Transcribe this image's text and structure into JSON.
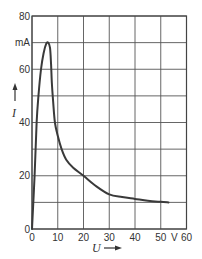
{
  "chart_data": {
    "type": "line",
    "title": "",
    "xlabel": "U",
    "ylabel": "I",
    "x_unit": "V",
    "y_unit": "mA",
    "xlim": [
      0,
      60
    ],
    "ylim": [
      0,
      80
    ],
    "grid": true,
    "x_ticks": [
      0,
      10,
      20,
      30,
      40,
      50,
      60
    ],
    "x_tick_labels": [
      "0",
      "10",
      "20",
      "30",
      "40",
      "50",
      "V",
      "60"
    ],
    "y_ticks": [
      0,
      10,
      20,
      30,
      40,
      50,
      60,
      70,
      80
    ],
    "y_tick_labels": [
      {
        "value": 80,
        "label": "80"
      },
      {
        "value": 70,
        "label": "mA"
      },
      {
        "value": 60,
        "label": "60"
      },
      {
        "value": 40,
        "label": "40"
      },
      {
        "value": 20,
        "label": "20"
      },
      {
        "value": 0,
        "label": "0"
      }
    ],
    "series": [
      {
        "name": "I(U)",
        "color": "#3a3a3a",
        "points": [
          [
            0,
            0
          ],
          [
            1,
            20
          ],
          [
            1.8,
            40
          ],
          [
            2.5,
            50
          ],
          [
            3.5,
            60
          ],
          [
            4.5,
            66
          ],
          [
            5.5,
            69.5
          ],
          [
            6.3,
            70
          ],
          [
            7,
            68
          ],
          [
            7.4,
            62
          ],
          [
            7.7,
            55
          ],
          [
            8.2,
            48
          ],
          [
            8.9,
            40
          ],
          [
            10,
            35
          ],
          [
            11.5,
            30
          ],
          [
            13.3,
            26
          ],
          [
            16,
            23
          ],
          [
            20,
            20
          ],
          [
            25,
            16
          ],
          [
            30,
            13
          ],
          [
            35,
            12
          ],
          [
            40,
            11.3
          ],
          [
            45,
            10.6
          ],
          [
            50,
            10.2
          ],
          [
            53,
            10
          ]
        ]
      }
    ]
  },
  "labels": {
    "x_axis": "U",
    "y_axis": "I",
    "x_unit": "V",
    "y_unit": "mA"
  }
}
